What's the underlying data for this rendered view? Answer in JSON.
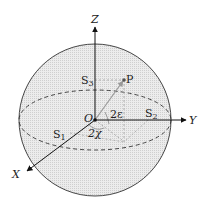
{
  "diagram": {
    "axes": {
      "x": "X",
      "y": "Y",
      "z": "Z"
    },
    "origin": "O",
    "point": "P",
    "stokes": {
      "s1": "S",
      "s1_sub": "1",
      "s2": "S",
      "s2_sub": "2",
      "s3": "S",
      "s3_sub": "3"
    },
    "angles": {
      "epsilon": "2ε",
      "chi": "2χ"
    },
    "colors": {
      "sphere_fill": "#e4e4e4",
      "outline": "#333333",
      "projection": "#a8a8a8"
    }
  }
}
